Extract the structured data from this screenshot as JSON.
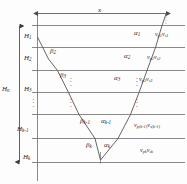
{
  "figure": {
    "type": "seismic-layered-raypath-diagram",
    "offset_label": "x",
    "total_depth_label": "H",
    "total_depth_sub": "n",
    "vertical_ellipsis": "⋮"
  },
  "layers": [
    {
      "index": 1,
      "thickness": "H",
      "thickness_sub": "1",
      "vp": "v",
      "vp_sub": "p1",
      "vs": "v",
      "vs_sub": "s1",
      "alpha": "α",
      "alpha_sub": "1",
      "beta": "",
      "beta_sub": ""
    },
    {
      "index": 2,
      "thickness": "H",
      "thickness_sub": "2",
      "vp": "v",
      "vp_sub": "p2",
      "vs": "v",
      "vs_sub": "s2",
      "alpha": "α",
      "alpha_sub": "2",
      "beta": "β",
      "beta_sub": "2"
    },
    {
      "index": 3,
      "thickness": "H",
      "thickness_sub": "3",
      "vp": "v",
      "vp_sub": "p3",
      "vs": "v",
      "vs_sub": "s3",
      "alpha": "α",
      "alpha_sub": "3",
      "beta": "β",
      "beta_sub": "3"
    },
    {
      "index": 4,
      "thickness": "H",
      "thickness_sub": "k-1",
      "vp": "v",
      "vp_sub": "p(k-1)",
      "vs": "v",
      "vs_sub": "s(k-1)",
      "alpha": "α",
      "alpha_sub": "k-1",
      "beta": "β",
      "beta_sub": "k-1"
    },
    {
      "index": 5,
      "thickness": "H",
      "thickness_sub": "k",
      "vp": "v",
      "vp_sub": "pk",
      "vs": "v",
      "vs_sub": "sk",
      "alpha": "α",
      "alpha_sub": "k",
      "beta": "β",
      "beta_sub": "k"
    }
  ],
  "labels": {
    "x": "x",
    "Hn": "H",
    "Hn_sub": "n",
    "H1": "H",
    "H1_sub": "1",
    "H2": "H",
    "H2_sub": "2",
    "H3": "H",
    "H3_sub": "3",
    "Hk1": "H",
    "Hk1_sub": "k-1",
    "Hk": "H",
    "Hk_sub": "k",
    "a1": "α",
    "a1_sub": "1",
    "a2": "α",
    "a2_sub": "2",
    "a3": "α",
    "a3_sub": "3",
    "ak1": "α",
    "ak1_sub": "k-1",
    "ak": "α",
    "ak_sub": "k",
    "b2": "β",
    "b2_sub": "2",
    "b3": "β",
    "b3_sub": "3",
    "bk1": "β",
    "bk1_sub": "k-1",
    "bk": "β",
    "bk_sub": "k",
    "v1p": "v",
    "v1p_sub": "p1",
    "v1s": "v",
    "v1s_sub": "s1",
    "v2p": "v",
    "v2p_sub": "p2",
    "v2s": "v",
    "v2s_sub": "s2",
    "v3p": "v",
    "v3p_sub": "p3",
    "v3s": "v",
    "v3s_sub": "s3",
    "vk1p": "v",
    "vk1p_sub": "p(k-1)",
    "vk1s": "v",
    "vk1s_sub": "s(k-1)",
    "vkp": "v",
    "vkp_sub": "pk",
    "vks": "v",
    "vks_sub": "sk",
    "ellipsis": "⋮"
  },
  "colors": {
    "line": "#6b6b6b",
    "ray": "#555555",
    "text": "#2a2a2a",
    "background": "#fdfdfd"
  }
}
